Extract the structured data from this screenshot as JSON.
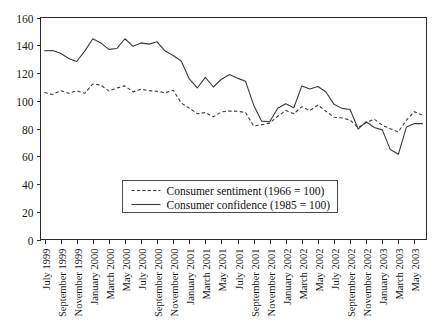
{
  "chart_data": {
    "type": "line",
    "title": "",
    "subtitle": "",
    "xlabel": "",
    "ylabel": "",
    "ylim": [
      0,
      160
    ],
    "ytick_labels": [
      "0",
      "20",
      "40",
      "60",
      "80",
      "100",
      "120",
      "140",
      "160"
    ],
    "ytick_values": [
      0,
      20,
      40,
      60,
      80,
      100,
      120,
      140,
      160
    ],
    "grid": false,
    "legend_position": "lower-center-inside",
    "x": [
      "July 1999",
      "August 1999",
      "September 1999",
      "October 1999",
      "November 1999",
      "December 1999",
      "January 2000",
      "February 2000",
      "March 2000",
      "April 2000",
      "May 2000",
      "June 2000",
      "July 2000",
      "August 2000",
      "September 2000",
      "October 2000",
      "November 2000",
      "December 2000",
      "January 2001",
      "February 2001",
      "March 2001",
      "April 2001",
      "May 2001",
      "June 2001",
      "July 2001",
      "August 2001",
      "September 2001",
      "October 2001",
      "November 2001",
      "December 2001",
      "January 2002",
      "February 2002",
      "March 2002",
      "April 2002",
      "May 2002",
      "June 2002",
      "July 2002",
      "August 2002",
      "September 2002",
      "October 2002",
      "November 2002",
      "December 2002",
      "January 2003",
      "February 2003",
      "March 2003",
      "April 2003",
      "May 2003",
      "June 2003"
    ],
    "xtick_labels": [
      "July 1999",
      "September 1999",
      "November 1999",
      "January 2000",
      "March 2000",
      "May 2000",
      "July 2000",
      "September 2000",
      "November 2000",
      "January 2001",
      "March 2001",
      "May 2001",
      "July 2001",
      "September 2001",
      "November 2001",
      "January 2002",
      "March 2002",
      "May 2002",
      "July 2002",
      "September 2002",
      "November 2002",
      "January 2003",
      "March 2003",
      "May 2003"
    ],
    "xtick_indices": [
      0,
      2,
      4,
      6,
      8,
      10,
      12,
      14,
      16,
      18,
      20,
      22,
      24,
      26,
      28,
      30,
      32,
      34,
      36,
      38,
      40,
      42,
      44,
      46
    ],
    "series": [
      {
        "name": "Consumer sentiment (1966 = 100)",
        "style": "dashed",
        "base_year": "1966 = 100",
        "values": [
          106,
          104.5,
          107.2,
          105.4,
          107.2,
          105.4,
          112,
          111.3,
          107.1,
          109.2,
          110.7,
          106.4,
          108.3,
          107.3,
          106.8,
          105.8,
          107.6,
          98.4,
          94.7,
          90.6,
          91.5,
          88.4,
          92,
          92.6,
          92.4,
          91.5,
          81.8,
          82.7,
          83.9,
          88.8,
          93,
          90.7,
          95.7,
          93,
          96.9,
          92.4,
          88.1,
          87.6,
          86.1,
          80.6,
          84.2,
          86.7,
          82.4,
          79.9,
          77.6,
          86,
          92.1,
          89.7
        ]
      },
      {
        "name": "Consumer confidence (1985 = 100)",
        "style": "solid",
        "base_year": "1985 = 100",
        "values": [
          136,
          136.2,
          134.2,
          130.5,
          128.3,
          135.8,
          144.7,
          141.7,
          137,
          137.7,
          144.7,
          139.2,
          141.7,
          140.8,
          142.5,
          135.8,
          132.6,
          128.6,
          115.7,
          109.2,
          116.9,
          109.9,
          115.5,
          118.9,
          116.3,
          114,
          97,
          85.3,
          84.9,
          94.6,
          97.8,
          95,
          110.7,
          108.5,
          110.3,
          106.3,
          97.4,
          94.5,
          93.7,
          79.6,
          84.9,
          80.7,
          79,
          64.8,
          61.4,
          81,
          83.6,
          83.5
        ]
      }
    ]
  },
  "legend": {
    "items": [
      {
        "label": "Consumer sentiment (1966 = 100)",
        "style": "dashed"
      },
      {
        "label": "Consumer confidence (1985 = 100)",
        "style": "solid"
      }
    ]
  },
  "axes": {
    "y_min_label": "0",
    "y_max_label": "160"
  }
}
